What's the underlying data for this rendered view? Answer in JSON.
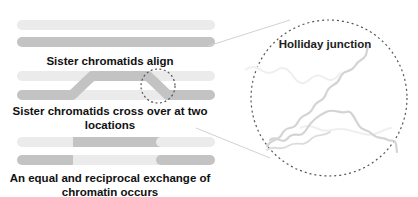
{
  "diagram": {
    "colors": {
      "light_strand": "#ebebeb",
      "dark_strand": "#c3c3c3",
      "wave_strand": "#d4d4d4",
      "faint_wave": "#eeeeee",
      "dashed_outline": "#555555",
      "connector": "#cfcfcf",
      "text": "#111111"
    },
    "steps": [
      {
        "id": "align",
        "label_lines": [
          "Sister chromatids align"
        ]
      },
      {
        "id": "crossover",
        "label_lines": [
          "Sister chromatids cross over at two",
          "locations"
        ]
      },
      {
        "id": "exchange",
        "label_lines": [
          "An equal and reciprocal exchange of",
          "chromatin occurs"
        ]
      }
    ],
    "zoom_panel": {
      "label": "Holliday junction"
    }
  }
}
